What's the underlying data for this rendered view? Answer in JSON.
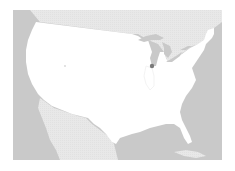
{
  "map": {
    "type": "reference-map",
    "region": "Contiguous United States",
    "colors": {
      "background": "#ffffff",
      "ocean": "#c9c9c9",
      "neighbor_land": "#e8e8e8",
      "focus_land": "#ffffff",
      "lakes": "#c9c9c9",
      "marker": "#7a7a7a",
      "outline": "#f0f0f0"
    },
    "frame": {
      "x": 13,
      "y": 10,
      "width": 209,
      "height": 150
    },
    "markers": [
      {
        "name": "point-marker-great-lakes",
        "x": 152,
        "y": 66,
        "r": 2.2
      },
      {
        "name": "point-marker-west",
        "x": 65,
        "y": 66,
        "r": 0.9
      }
    ],
    "labels": []
  }
}
